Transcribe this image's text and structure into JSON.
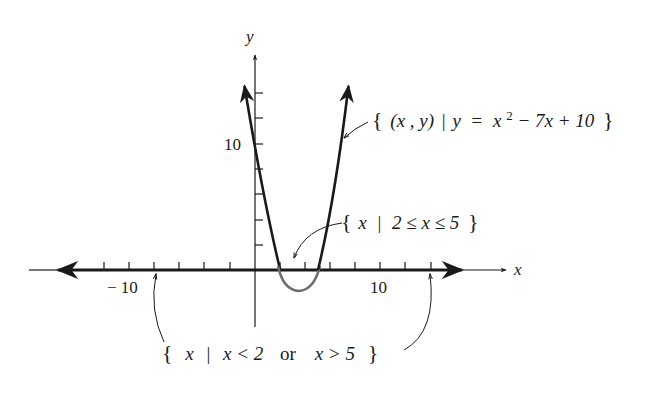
{
  "figure": {
    "axes": {
      "x_label": "x",
      "y_label": "y",
      "x_tick_labels": [
        {
          "value": -10,
          "text": "− 10"
        },
        {
          "value": 10,
          "text": "10"
        }
      ],
      "y_tick_labels": [
        {
          "value": 10,
          "text": "10"
        }
      ],
      "tick_step": 2
    },
    "curve": {
      "equation": "y = x² − 7x + 10",
      "roots": [
        2,
        5
      ],
      "vertex": [
        3.5,
        -2.25
      ]
    },
    "annotations": {
      "curve_set": "{ (x , y) | y = x² − 7x + 10 }",
      "curve_set_parts": {
        "open": "{",
        "pair": "(x , y)",
        "bar": "|",
        "lhs": "y",
        "eq": "=",
        "x": "x",
        "sup": "2",
        "rest": " − 7x + 10",
        "close": "}"
      },
      "interval_set": "{ x | 2 ≤ x ≤ 5 }",
      "interval_set_parts": {
        "open": "{",
        "var": "x",
        "bar": "|",
        "body": "2 ≤ x ≤ 5",
        "close": "}"
      },
      "outside_set": "{ x | x < 2 or x > 5 }",
      "outside_set_parts": {
        "open": "{",
        "var": "x",
        "bar": "|",
        "body_a": "x < 2",
        "or": "or",
        "body_b": "x > 5",
        "close": "}"
      }
    },
    "colors": {
      "ink": "#1a1a1a",
      "negative_region": "#6e6e6e"
    }
  }
}
